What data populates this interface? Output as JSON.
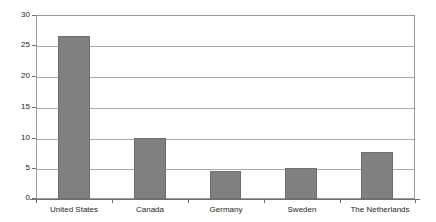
{
  "chart_data": {
    "type": "bar",
    "title": "",
    "subtitle": "",
    "xlabel": "",
    "ylabel": "",
    "categories": [
      "United States",
      "Canada",
      "Germany",
      "Sweden",
      "The Netherlands"
    ],
    "values": [
      26.5,
      10.0,
      4.6,
      5.0,
      7.7
    ],
    "series": [
      {
        "name": "",
        "values": [
          26.5,
          10.0,
          4.6,
          5.0,
          7.7
        ]
      }
    ],
    "ylim": [
      0,
      30
    ],
    "ytick_values": [
      0,
      5,
      10,
      15,
      20,
      25,
      30
    ],
    "ytick_labels": [
      "0",
      "5",
      "10",
      "15",
      "20",
      "25",
      "30"
    ],
    "grid": true,
    "grid_axis": "y",
    "legend": null,
    "legend_position": "none",
    "annotations": [],
    "bar_color": "#808080",
    "bar_edge_color": "#6e6e6e",
    "grid_color": "#a8a8a8",
    "frame_color": "#9a9a9a",
    "axis_color": "#6f6f6f",
    "text_color": "#231f20",
    "background_color": "#ffffff"
  }
}
